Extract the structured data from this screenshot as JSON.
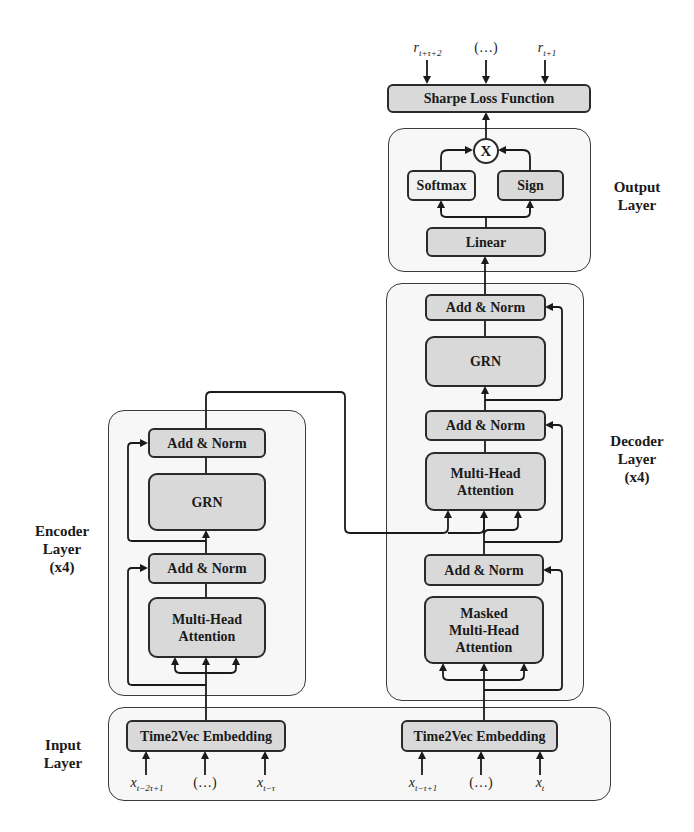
{
  "diagram": {
    "top_outputs": [
      {
        "var": "r",
        "sub": "t+τ+2"
      },
      {
        "text": "(…)"
      },
      {
        "var": "r",
        "sub": "t+1"
      }
    ],
    "loss": {
      "label": "Sharpe Loss Function"
    },
    "output_layer": {
      "title_line1": "Output",
      "title_line2": "Layer",
      "multiply_symbol": "X",
      "softmax": "Softmax",
      "sign": "Sign",
      "linear": "Linear"
    },
    "decoder_layer": {
      "title_line1": "Decoder",
      "title_line2": "Layer",
      "title_line3": "(x4)",
      "blocks": [
        "Add & Norm",
        "GRN",
        "Add & Norm",
        "Multi-Head Attention",
        "Add & Norm",
        "Masked Multi-Head Attention"
      ],
      "mha_line1": "Multi-Head",
      "mha_line2": "Attention",
      "masked_line1": "Masked",
      "masked_line2": "Multi-Head",
      "masked_line3": "Attention"
    },
    "encoder_layer": {
      "title_line1": "Encoder",
      "title_line2": "Layer",
      "title_line3": "(x4)",
      "blocks": [
        "Add & Norm",
        "GRN",
        "Add & Norm",
        "Multi-Head Attention"
      ],
      "mha_line1": "Multi-Head",
      "mha_line2": "Attention"
    },
    "input_layer": {
      "title_line1": "Input",
      "title_line2": "Layer",
      "encoder_embedding": "Time2Vec Embedding",
      "decoder_embedding": "Time2Vec Embedding",
      "encoder_inputs": [
        {
          "var": "x",
          "sub": "t−2τ+1"
        },
        {
          "text": "(…)"
        },
        {
          "var": "x",
          "sub": "t−τ"
        }
      ],
      "decoder_inputs": [
        {
          "var": "x",
          "sub": "t−τ+1"
        },
        {
          "text": "(…)"
        },
        {
          "var": "x",
          "sub": "t"
        }
      ]
    },
    "colors": {
      "block_fill": "#d9d9d9",
      "light_block_fill": "#f1f1f1",
      "container_fill": "#f7f7f7",
      "stroke": "#2a2a2a"
    }
  }
}
